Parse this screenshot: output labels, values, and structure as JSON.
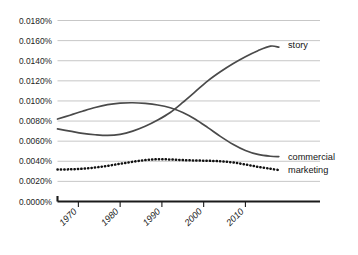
{
  "chart_data": {
    "type": "line",
    "title": "",
    "subtitle": "",
    "xlabel": "",
    "ylabel": "",
    "grid": true,
    "legend_position": "inline-right",
    "xlim": [
      1965,
      2019
    ],
    "ylim": [
      0.0,
      0.018
    ],
    "y_ticks": [
      "0.0000%",
      "0.0020%",
      "0.0040%",
      "0.0060%",
      "0.0080%",
      "0.0100%",
      "0.0120%",
      "0.0140%",
      "0.0160%",
      "0.0180%"
    ],
    "y_tick_values": [
      0.0,
      0.002,
      0.004,
      0.006,
      0.008,
      0.01,
      0.012,
      0.014,
      0.016,
      0.018
    ],
    "x_ticks": [
      "1970",
      "1980",
      "1990",
      "2000",
      "2010"
    ],
    "x_tick_values": [
      1970,
      1980,
      1990,
      2000,
      2010
    ],
    "x": [
      1965,
      1968,
      1971,
      1974,
      1977,
      1980,
      1983,
      1986,
      1989,
      1992,
      1995,
      1998,
      2001,
      2004,
      2007,
      2010,
      2013,
      2016,
      2018
    ],
    "series": [
      {
        "name": "story",
        "style": "solid",
        "color": "#4a4a4a",
        "values": [
          0.00722,
          0.007,
          0.00678,
          0.00664,
          0.00657,
          0.00668,
          0.007,
          0.00748,
          0.0081,
          0.00885,
          0.00985,
          0.01093,
          0.012,
          0.0129,
          0.0137,
          0.0144,
          0.015,
          0.01545,
          0.01535
        ]
      },
      {
        "name": "commercial",
        "style": "solid",
        "color": "#4a4a4a",
        "values": [
          0.0082,
          0.00858,
          0.00898,
          0.00935,
          0.00963,
          0.00978,
          0.00982,
          0.00975,
          0.0096,
          0.00932,
          0.00885,
          0.00818,
          0.00735,
          0.00648,
          0.0057,
          0.00508,
          0.00468,
          0.0045,
          0.00447
        ]
      },
      {
        "name": "marketing",
        "style": "dotted",
        "color": "#111111",
        "values": [
          0.00318,
          0.0032,
          0.00326,
          0.00338,
          0.00355,
          0.00375,
          0.00395,
          0.00412,
          0.0042,
          0.00418,
          0.00412,
          0.00408,
          0.00405,
          0.004,
          0.00388,
          0.00368,
          0.00345,
          0.00325,
          0.00313
        ]
      }
    ],
    "series_labels": [
      {
        "name": "story",
        "label": "story"
      },
      {
        "name": "commercial",
        "label": "commercial"
      },
      {
        "name": "marketing",
        "label": "marketing"
      }
    ]
  }
}
